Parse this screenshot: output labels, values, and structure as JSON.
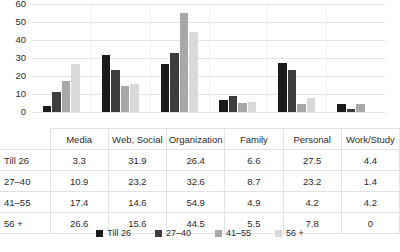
{
  "chart_data": {
    "type": "bar",
    "title": "",
    "xlabel": "",
    "ylabel": "",
    "ylim": [
      0,
      60
    ],
    "yticks": [
      0,
      10,
      20,
      30,
      40,
      50,
      60
    ],
    "grid": true,
    "legend_position": "bottom",
    "categories": [
      "Media",
      "Web, Social",
      "Organization",
      "Family",
      "Personal",
      "Work/Study"
    ],
    "series": [
      {
        "name": "Till 26",
        "color": "#1a1a1a",
        "values": [
          3.3,
          31.9,
          26.4,
          6.6,
          27.5,
          4.4
        ]
      },
      {
        "name": "27–40",
        "color": "#3d3d3d",
        "values": [
          10.9,
          23.2,
          32.6,
          8.7,
          23.2,
          1.4
        ]
      },
      {
        "name": "41–55",
        "color": "#a8a8a8",
        "values": [
          17.4,
          14.6,
          54.9,
          4.9,
          4.2,
          4.2
        ]
      },
      {
        "name": "56 +",
        "color": "#d9d9d9",
        "values": [
          26.6,
          15.6,
          44.5,
          5.5,
          7.8,
          0
        ]
      }
    ]
  },
  "table": {
    "corner_label": "",
    "headers": [
      "Media",
      "Web, Social",
      "Organization",
      "Family",
      "Personal",
      "Work/Study"
    ],
    "rows": [
      {
        "label": "Till 26",
        "values": [
          "3.3",
          "31.9",
          "26.4",
          "6.6",
          "27.5",
          "4.4"
        ]
      },
      {
        "label": "27–40",
        "values": [
          "10.9",
          "23.2",
          "32.6",
          "8.7",
          "23.2",
          "1.4"
        ]
      },
      {
        "label": "41–55",
        "values": [
          "17.4",
          "14.6",
          "54.9",
          "4.9",
          "4.2",
          "4.2"
        ]
      },
      {
        "label": "56 +",
        "values": [
          "26.6",
          "15.6",
          "44.5",
          "5.5",
          "7.8",
          "0"
        ]
      }
    ]
  },
  "legend": {
    "items": [
      {
        "label": "Till 26",
        "color": "#1a1a1a"
      },
      {
        "label": "27–40",
        "color": "#3d3d3d"
      },
      {
        "label": "41–55",
        "color": "#a8a8a8"
      },
      {
        "label": "56 +",
        "color": "#d9d9d9"
      }
    ]
  }
}
